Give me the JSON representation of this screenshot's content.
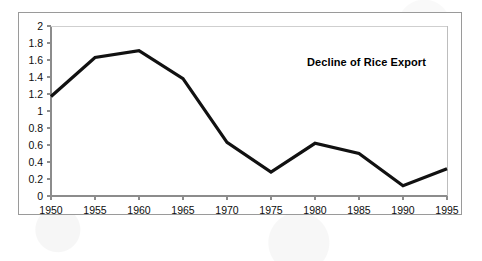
{
  "chart_data": {
    "type": "line",
    "title": "Decline of Rice Export",
    "xlabel": "",
    "ylabel": "",
    "categories": [
      "1950",
      "1955",
      "1960",
      "1965",
      "1970",
      "1975",
      "1980",
      "1985",
      "1990",
      "1995"
    ],
    "values": [
      1.17,
      1.63,
      1.71,
      1.38,
      0.63,
      0.28,
      0.62,
      0.5,
      0.12,
      0.32
    ],
    "series": [
      {
        "name": "Rice Export",
        "values": [
          1.17,
          1.63,
          1.71,
          1.38,
          0.63,
          0.28,
          0.62,
          0.5,
          0.12,
          0.32
        ]
      }
    ],
    "ylim": [
      0,
      2
    ],
    "ytick_labels": [
      "0",
      "0.2",
      "0.4",
      "0.6",
      "0.8",
      "1",
      "1.2",
      "1.4",
      "1.6",
      "1.8",
      "2"
    ],
    "ytick_values": [
      0,
      0.2,
      0.4,
      0.6,
      0.8,
      1,
      1.2,
      1.4,
      1.6,
      1.8,
      2
    ],
    "xtick_labels": [
      "1950",
      "1955",
      "1960",
      "1965",
      "1970",
      "1975",
      "1980",
      "1985",
      "1990",
      "1995"
    ],
    "grid": false,
    "legend": "none",
    "line_color": "#111111",
    "axis_color": "#8c8c8c",
    "frame_color": "#9a9a9a",
    "background": "#ffffff",
    "title_position": "inside-top-right",
    "markers": false,
    "line_width": 3.2
  }
}
